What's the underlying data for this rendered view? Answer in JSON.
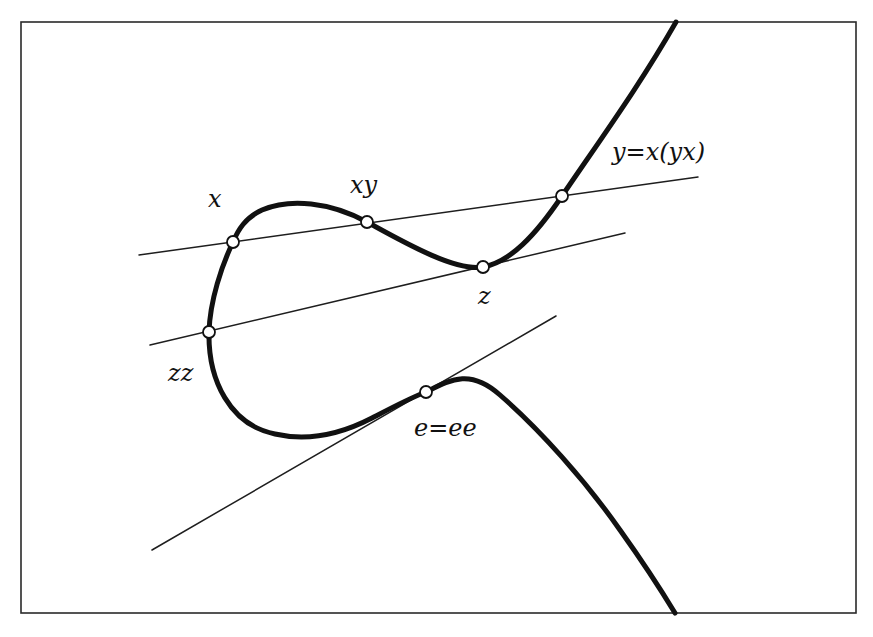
{
  "figure": {
    "labels": {
      "x": "x",
      "xy": "xy",
      "y": "y=x(yx)",
      "z": "z",
      "zz": "zz",
      "e": "e=ee"
    },
    "points": [
      {
        "name": "x",
        "cx": 233,
        "cy": 242
      },
      {
        "name": "xy",
        "cx": 367,
        "cy": 222
      },
      {
        "name": "y",
        "cx": 562,
        "cy": 196
      },
      {
        "name": "z",
        "cx": 483,
        "cy": 267
      },
      {
        "name": "zz",
        "cx": 209,
        "cy": 332
      },
      {
        "name": "e",
        "cx": 426,
        "cy": 392
      }
    ],
    "lines": [
      {
        "name": "secant-x-xy-y",
        "through": [
          "x",
          "xy",
          "y"
        ]
      },
      {
        "name": "tangent-z-zz",
        "through": [
          "zz",
          "z"
        ]
      },
      {
        "name": "tangent-e",
        "through": [
          "e"
        ]
      }
    ],
    "colors": {
      "curve": "#111111",
      "lines": "#1e1e1e",
      "frame": "#2a2a2a",
      "point_fill": "#ffffff",
      "background": "#ffffff"
    }
  }
}
